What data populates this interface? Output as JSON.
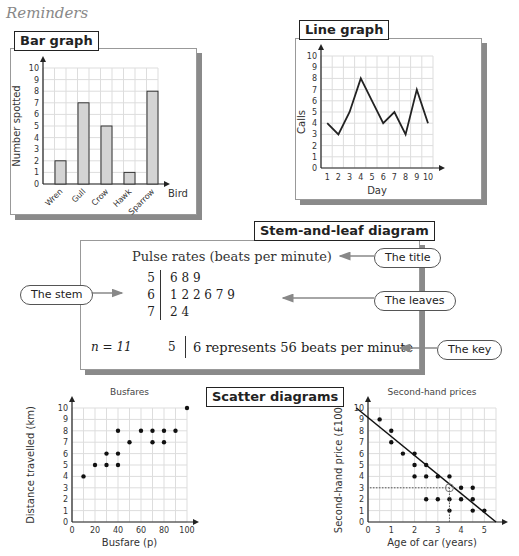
{
  "page": {
    "heading": "Reminders"
  },
  "bar_graph": {
    "tag": "Bar graph",
    "ylabel": "Number spotted",
    "xlabel": "Bird",
    "yticks": [
      "0",
      "1",
      "2",
      "3",
      "4",
      "5",
      "6",
      "7",
      "8",
      "9",
      "10"
    ]
  },
  "line_graph": {
    "tag": "Line graph",
    "ylabel": "Calls",
    "xlabel": "Day",
    "yticks": [
      "0",
      "1",
      "2",
      "3",
      "4",
      "5",
      "6",
      "7",
      "8",
      "9",
      "10"
    ],
    "xticks": [
      "1",
      "2",
      "3",
      "4",
      "5",
      "6",
      "7",
      "8",
      "9",
      "10"
    ]
  },
  "stem_leaf": {
    "tag": "Stem-and-leaf diagram",
    "title": "Pulse rates (beats per minute)",
    "rows": [
      {
        "stem": "5",
        "leaves": "6 8 9"
      },
      {
        "stem": "6",
        "leaves": "1 2 2 6 7 9"
      },
      {
        "stem": "7",
        "leaves": "2 4"
      }
    ],
    "n_label": "n = 11",
    "key_stem": "5",
    "key_text": "6 represents 56 beats per minute",
    "callouts": {
      "title": "The title",
      "stem": "The stem",
      "leaves": "The leaves",
      "key": "The key"
    }
  },
  "scatter": {
    "tag": "Scatter diagrams",
    "busfares": {
      "title": "Busfares",
      "xlabel": "Busfare (p)",
      "ylabel": "Distance travelled (km)",
      "xticks": [
        "0",
        "20",
        "40",
        "60",
        "80",
        "100"
      ],
      "yticks": [
        "0",
        "1",
        "2",
        "3",
        "4",
        "5",
        "6",
        "7",
        "8",
        "9",
        "10"
      ]
    },
    "secondhand": {
      "title": "Second-hand prices",
      "xlabel": "Age of car (years)",
      "ylabel": "Second-hand price (£1000)",
      "xticks": [
        "0",
        "1",
        "2",
        "3",
        "4",
        "5"
      ],
      "yticks": [
        "0",
        "1",
        "2",
        "3",
        "4",
        "5",
        "6",
        "7",
        "8",
        "9",
        "10"
      ]
    }
  },
  "chart_data": [
    {
      "type": "bar",
      "title": "Bar graph",
      "categories": [
        "Wren",
        "Gull",
        "Crow",
        "Hawk",
        "Sparrow"
      ],
      "values": [
        2,
        7,
        5,
        1,
        8
      ],
      "xlabel": "Bird",
      "ylabel": "Number spotted",
      "ylim": [
        0,
        10
      ],
      "grid": true
    },
    {
      "type": "line",
      "title": "Line graph",
      "x": [
        1,
        2,
        3,
        4,
        5,
        6,
        7,
        8,
        9,
        10
      ],
      "values": [
        4,
        3,
        5,
        8,
        6,
        4,
        5,
        3,
        7,
        4
      ],
      "xlabel": "Day",
      "ylabel": "Calls",
      "ylim": [
        0,
        10
      ],
      "grid": true
    },
    {
      "type": "table",
      "title": "Pulse rates (beats per minute)",
      "stems": [
        5,
        6,
        7
      ],
      "leaves": [
        [
          6,
          8,
          9
        ],
        [
          1,
          2,
          2,
          6,
          7,
          9
        ],
        [
          2,
          4
        ]
      ],
      "n": 11,
      "key": "5 | 6 represents 56 beats per minute"
    },
    {
      "type": "scatter",
      "title": "Busfares",
      "points": [
        [
          10,
          4
        ],
        [
          20,
          5
        ],
        [
          30,
          5
        ],
        [
          30,
          6
        ],
        [
          40,
          5
        ],
        [
          40,
          6
        ],
        [
          40,
          8
        ],
        [
          50,
          7
        ],
        [
          60,
          8
        ],
        [
          70,
          8
        ],
        [
          70,
          7
        ],
        [
          80,
          8
        ],
        [
          80,
          7
        ],
        [
          90,
          8
        ],
        [
          100,
          10
        ]
      ],
      "xlabel": "Busfare (p)",
      "ylabel": "Distance travelled (km)",
      "xlim": [
        0,
        100
      ],
      "ylim": [
        0,
        10
      ],
      "grid": true
    },
    {
      "type": "scatter",
      "title": "Second-hand prices",
      "points": [
        [
          0.5,
          9
        ],
        [
          1,
          8
        ],
        [
          1,
          7
        ],
        [
          1.5,
          6
        ],
        [
          2,
          6
        ],
        [
          2,
          5
        ],
        [
          2,
          4
        ],
        [
          2.5,
          5
        ],
        [
          2.5,
          4
        ],
        [
          2.5,
          2
        ],
        [
          3,
          4
        ],
        [
          3,
          2
        ],
        [
          3.5,
          4
        ],
        [
          3.5,
          2
        ],
        [
          3.5,
          1
        ],
        [
          4,
          3
        ],
        [
          4,
          2
        ],
        [
          4.5,
          3
        ],
        [
          4.5,
          2
        ],
        [
          4.5,
          1
        ],
        [
          5,
          1
        ]
      ],
      "line_of_best_fit": [
        [
          -0.5,
          10
        ],
        [
          5.5,
          0
        ]
      ],
      "estimate": {
        "x": 3.5,
        "y": 3
      },
      "xlabel": "Age of car (years)",
      "ylabel": "Second-hand price (£1000)",
      "xlim": [
        0,
        5.5
      ],
      "ylim": [
        0,
        10
      ],
      "grid": true
    }
  ]
}
